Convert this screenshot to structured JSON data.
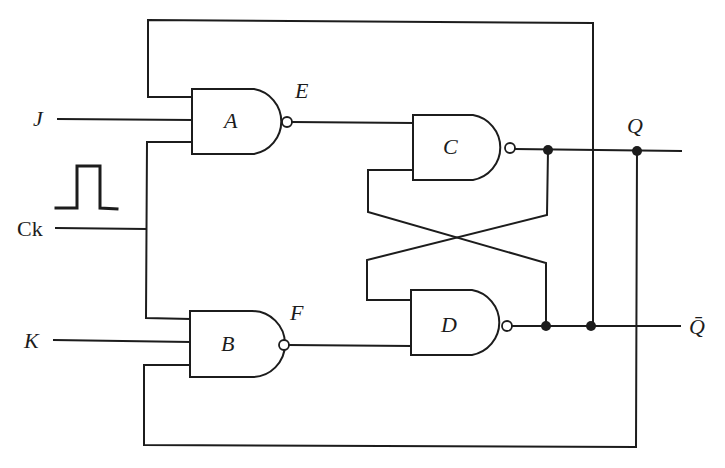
{
  "diagram": {
    "type": "JK flip-flop built from NAND gates",
    "inputs": {
      "j": "J",
      "k": "K",
      "clock": "Ck"
    },
    "gates": {
      "a": "A",
      "b": "B",
      "c": "C",
      "d": "D"
    },
    "nodes": {
      "e": "E",
      "f": "F"
    },
    "outputs": {
      "q": "Q",
      "q_bar": "Q̄"
    },
    "colors": {
      "line": "#1c1c1c",
      "background": "#ffffff"
    }
  }
}
